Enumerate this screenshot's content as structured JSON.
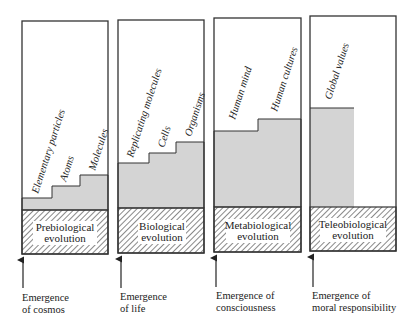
{
  "diagram": {
    "type": "evolution-stages",
    "colors": {
      "stroke": "#333333",
      "fill": "#d4d4d4",
      "hatch": "#555555",
      "text": "#222222"
    },
    "panels": [
      {
        "stage": [
          "Prebiological",
          "evolution"
        ],
        "levels": [
          "Elementary particles",
          "Atoms",
          "Molecules"
        ],
        "emergence": [
          "Emergence",
          "of cosmos"
        ]
      },
      {
        "stage": [
          "Biological",
          "evolution"
        ],
        "levels": [
          "Replicating molecules",
          "Cells",
          "Organisms"
        ],
        "emergence": [
          "Emergence",
          "of life"
        ]
      },
      {
        "stage": [
          "Metabiological",
          "evolution"
        ],
        "levels": [
          "Human mind",
          "Human cultures"
        ],
        "emergence": [
          "Emergence of",
          "consciousness"
        ]
      },
      {
        "stage": [
          "Teleobiological",
          "evolution"
        ],
        "levels": [
          "Global values"
        ],
        "emergence": [
          "Emergence of",
          "moral responsibility"
        ]
      }
    ]
  }
}
